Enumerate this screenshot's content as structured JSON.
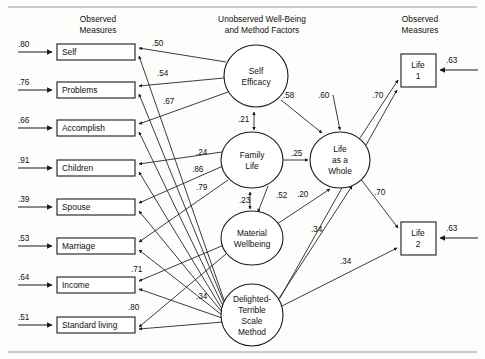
{
  "figure": {
    "headers": {
      "left": "Observed\nMeasures",
      "left_line1": "Observed",
      "left_line2": "Measures",
      "center_line1": "Unobserved  Well-Being",
      "center_line2": "and Method Factors",
      "right_line1": "Observed",
      "right_line2": "Measures"
    },
    "colors": {
      "ink": "#1a1a1a",
      "paper": "#fdfdfb",
      "rule": "#9a9a92"
    }
  },
  "observed_left": [
    {
      "id": "self",
      "label": "Self",
      "residual": ".80",
      "x": 57,
      "y": 44,
      "w": 78,
      "h": 16
    },
    {
      "id": "problems",
      "label": "Problems",
      "residual": ".76",
      "x": 57,
      "y": 82,
      "w": 78,
      "h": 16
    },
    {
      "id": "accomplish",
      "label": "Accomplish",
      "residual": ".66",
      "x": 57,
      "y": 120,
      "w": 78,
      "h": 16
    },
    {
      "id": "children",
      "label": "Children",
      "residual": ".91",
      "x": 57,
      "y": 160,
      "w": 78,
      "h": 16
    },
    {
      "id": "spouse",
      "label": "Spouse",
      "residual": ".39",
      "x": 57,
      "y": 199,
      "w": 78,
      "h": 16
    },
    {
      "id": "marriage",
      "label": "Marriage",
      "residual": ".53",
      "x": 57,
      "y": 238,
      "w": 78,
      "h": 16
    },
    {
      "id": "income",
      "label": "Income",
      "residual": ".64",
      "x": 57,
      "y": 277,
      "w": 78,
      "h": 16
    },
    {
      "id": "standard_living",
      "label": "Standard living",
      "residual": ".51",
      "x": 57,
      "y": 317,
      "w": 78,
      "h": 16
    }
  ],
  "observed_right": [
    {
      "id": "life1",
      "line1": "Life",
      "line2": "1",
      "residual": ".63",
      "x": 401,
      "y": 54,
      "w": 35,
      "h": 33
    },
    {
      "id": "life2",
      "line1": "Life",
      "line2": "2",
      "residual": ".63",
      "x": 401,
      "y": 222,
      "w": 35,
      "h": 33
    }
  ],
  "latent_factors": [
    {
      "id": "self_efficacy",
      "lines": [
        "Self",
        "Efficacy"
      ],
      "cx": 256,
      "cy": 76,
      "rx": 32,
      "ry": 31
    },
    {
      "id": "family_life",
      "lines": [
        "Family",
        "Life"
      ],
      "cx": 252,
      "cy": 160,
      "rx": 31,
      "ry": 28
    },
    {
      "id": "material_wb",
      "lines": [
        "Material",
        "Wellbeing"
      ],
      "cx": 252,
      "cy": 238,
      "rx": 31,
      "ry": 27
    },
    {
      "id": "dt_method",
      "lines": [
        "Delighted-",
        "Terrible",
        "Scale",
        "Method"
      ],
      "cx": 252,
      "cy": 315,
      "rx": 31,
      "ry": 31
    },
    {
      "id": "life_whole",
      "lines": [
        "Life",
        "as a",
        "Whole"
      ],
      "cx": 340,
      "cy": 160,
      "rx": 30,
      "ry": 28
    }
  ],
  "loadings": {
    "self_efficacy": [
      {
        "target": "self",
        "value": ".50",
        "lx": 152,
        "ly": 46
      },
      {
        "target": "problems",
        "value": ".54",
        "lx": 157,
        "ly": 76
      },
      {
        "target": "accomplish",
        "value": ".67",
        "lx": 163,
        "ly": 104
      }
    ],
    "family_life": [
      {
        "target": "children",
        "value": ".24",
        "lx": 196,
        "ly": 155
      },
      {
        "target": "spouse",
        "value": ".86",
        "lx": 192,
        "ly": 172
      },
      {
        "target": "marriage",
        "value": ".79",
        "lx": 196,
        "ly": 190
      }
    ],
    "material_wb": [
      {
        "target": "income",
        "value": ".71",
        "lx": 131,
        "ly": 272
      },
      {
        "target": "standard_living",
        "value": ".80",
        "lx": 128,
        "ly": 310
      }
    ],
    "dt_method": [
      {
        "value": ".34",
        "lx": 196,
        "ly": 299
      }
    ]
  },
  "structural_paths": [
    {
      "from": "self_efficacy",
      "to": "life_whole",
      "value": ".58",
      "lx": 283,
      "ly": 98
    },
    {
      "from": "family_life",
      "to": "self_efficacy",
      "value": ".21",
      "lx": 238,
      "ly": 122,
      "type": "double"
    },
    {
      "from": "family_life",
      "to": "life_whole",
      "value": ".25",
      "lx": 291,
      "ly": 156
    },
    {
      "from": "material_wb",
      "to": "family_life",
      "value": ".23",
      "lx": 239,
      "ly": 203,
      "type": "double"
    },
    {
      "from": "family_life",
      "to": "material_wb",
      "value": ".52",
      "lx": 276,
      "ly": 198
    },
    {
      "from": "material_wb",
      "to": "life_whole",
      "value": ".20",
      "lx": 297,
      "ly": 197
    },
    {
      "from": "dt_method",
      "to": "life_whole",
      "value": ".34",
      "lx": 311,
      "ly": 232
    },
    {
      "from": "unknown",
      "to": "life_whole",
      "value": ".60",
      "lx": 318,
      "ly": 98
    },
    {
      "from": "life_whole",
      "to": "life1",
      "value": ".70",
      "lx": 372,
      "ly": 98
    },
    {
      "from": "life_whole",
      "to": "life2",
      "value": ".70",
      "lx": 374,
      "ly": 195
    },
    {
      "from": "dt_method",
      "to": "life2",
      "value": ".34",
      "lx": 340,
      "ly": 264
    }
  ]
}
